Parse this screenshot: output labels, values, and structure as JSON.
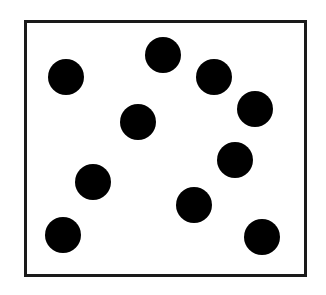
{
  "diagram": {
    "frame": {
      "left": 24,
      "top": 20,
      "right": 307,
      "bottom": 277,
      "border_color": "#1a1a1a",
      "fill_color": "#ffffff"
    },
    "dot_color": "#000000",
    "dot_diameter": 36,
    "dot_count": 10,
    "dots": [
      {
        "x": 66,
        "y": 77
      },
      {
        "x": 163,
        "y": 55
      },
      {
        "x": 214,
        "y": 77
      },
      {
        "x": 255,
        "y": 109
      },
      {
        "x": 138,
        "y": 122
      },
      {
        "x": 235,
        "y": 160
      },
      {
        "x": 93,
        "y": 182
      },
      {
        "x": 194,
        "y": 205
      },
      {
        "x": 63,
        "y": 235
      },
      {
        "x": 262,
        "y": 237
      }
    ]
  }
}
